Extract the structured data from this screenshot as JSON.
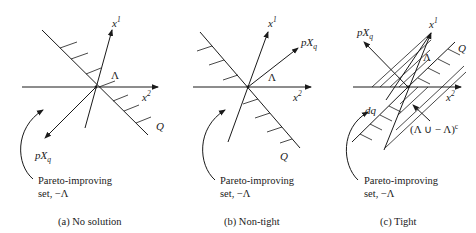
{
  "figure": {
    "panels": [
      {
        "id": "a",
        "caption": "(a)  No solution",
        "labels": {
          "x1_base": "x",
          "x1_sup": "1",
          "x2_base": "x",
          "x2_sup": "2",
          "lambda": "Λ",
          "pxq_p": "pX",
          "pxq_sub": "q",
          "q": "Q"
        },
        "pareto_line1": "Pareto-improving",
        "pareto_line2": "set, −Λ"
      },
      {
        "id": "b",
        "caption": "(b)  Non-tight",
        "labels": {
          "x1_base": "x",
          "x1_sup": "1",
          "x2_base": "x",
          "x2_sup": "2",
          "lambda": "Λ",
          "pxq_p": "pX",
          "pxq_sub": "q",
          "q": "Q"
        },
        "pareto_line1": "Pareto-improving",
        "pareto_line2": "set, −Λ"
      },
      {
        "id": "c",
        "caption": "(c)  Tight",
        "labels": {
          "x1_base": "x",
          "x1_sup": "1",
          "x2_base": "x",
          "x2_sup": "2",
          "lambda": "Λ",
          "pxq_p": "pX",
          "pxq_sub": "q",
          "q": "Q",
          "dq": "dq",
          "complement": "(Λ ∪ − Λ)",
          "complement_sup": "c"
        },
        "pareto_line1": "Pareto-improving",
        "pareto_line2": "set, −Λ"
      }
    ]
  }
}
